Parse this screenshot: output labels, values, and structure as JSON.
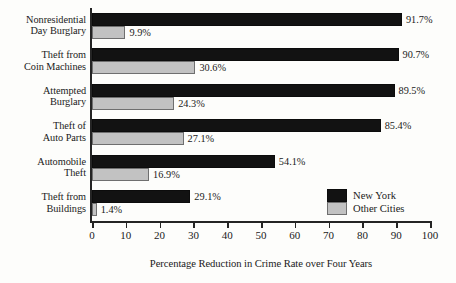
{
  "chart_data": {
    "type": "bar",
    "orientation": "horizontal",
    "title": "",
    "xlabel": "Percentage Reduction in Crime Rate over Four Years",
    "ylabel": "",
    "xlim": [
      0,
      100
    ],
    "xticks": [
      0,
      10,
      20,
      30,
      40,
      50,
      60,
      70,
      80,
      90,
      100
    ],
    "xtick_labels": [
      "0",
      "10",
      "20",
      "30",
      "40",
      "50",
      "60",
      "70",
      "80",
      "90",
      "100"
    ],
    "grid": false,
    "legend_position": "inside-right",
    "categories": [
      "Nonresidential Day Burglary",
      "Theft from Coin Machines",
      "Attempted Burglary",
      "Theft of Auto Parts",
      "Automobile Theft",
      "Theft from Buildings"
    ],
    "category_lines": [
      [
        "Nonresidential",
        "Day Burglary"
      ],
      [
        "Theft from",
        "Coin Machines"
      ],
      [
        "Attempted",
        "Burglary"
      ],
      [
        "Theft of",
        "Auto Parts"
      ],
      [
        "Automobile",
        "Theft"
      ],
      [
        "Theft from",
        "Buildings"
      ]
    ],
    "series": [
      {
        "name": "New York",
        "color": "#121212",
        "values": [
          91.7,
          90.7,
          89.5,
          85.4,
          54.1,
          29.1
        ],
        "value_labels": [
          "91.7%",
          "90.7%",
          "89.5%",
          "85.4%",
          "54.1%",
          "29.1%"
        ]
      },
      {
        "name": "Other Cities",
        "color": "#c2c2c2",
        "values": [
          9.9,
          30.6,
          24.3,
          27.1,
          16.9,
          1.4
        ],
        "value_labels": [
          "9.9%",
          "30.6%",
          "24.3%",
          "27.1%",
          "16.9%",
          "1.4%"
        ]
      }
    ]
  },
  "legend": {
    "items": [
      {
        "label": "New York",
        "swatch": "black-swatch"
      },
      {
        "label": "Other Cities",
        "swatch": "gray-swatch"
      }
    ]
  }
}
